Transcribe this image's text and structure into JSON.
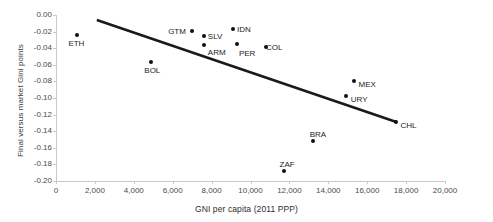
{
  "chart_data": {
    "type": "scatter",
    "title": "",
    "xlabel": "GNI per capita (2011 PPP)",
    "ylabel": "Final versus market Gini points",
    "xlim": [
      0,
      20000
    ],
    "ylim": [
      -0.2,
      0.0
    ],
    "grid": false,
    "legend": "none",
    "xticks": [
      "0",
      "2,000",
      "4,000",
      "6,000",
      "8,000",
      "10,000",
      "12,000",
      "14,000",
      "16,000",
      "18,000",
      "20,000"
    ],
    "xtick_values": [
      0,
      2000,
      4000,
      6000,
      8000,
      10000,
      12000,
      14000,
      16000,
      18000,
      20000
    ],
    "yticks": [
      "0.00",
      "-0.02",
      "-0.04",
      "-0.06",
      "-0.08",
      "-0.10",
      "-0.12",
      "-0.14",
      "-0.16",
      "-0.18",
      "-0.20"
    ],
    "ytick_values": [
      0.0,
      -0.02,
      -0.04,
      -0.06,
      -0.08,
      -0.1,
      -0.12,
      -0.14,
      -0.16,
      -0.18,
      -0.2
    ],
    "points": [
      {
        "label": "ETH",
        "x": 1100,
        "y": -0.024,
        "label_dx": -9,
        "label_dy": 4
      },
      {
        "label": "BOL",
        "x": 4900,
        "y": -0.057,
        "label_dx": -7,
        "label_dy": 4
      },
      {
        "label": "GTM",
        "x": 7000,
        "y": -0.019,
        "label_dx": -24,
        "label_dy": -4
      },
      {
        "label": "SLV",
        "x": 7600,
        "y": -0.025,
        "label_dx": 4,
        "label_dy": -4
      },
      {
        "label": "ARM",
        "x": 7600,
        "y": -0.036,
        "label_dx": 4,
        "label_dy": 3
      },
      {
        "label": "IDN",
        "x": 9100,
        "y": -0.017,
        "label_dx": 4,
        "label_dy": -4
      },
      {
        "label": "PER",
        "x": 9300,
        "y": -0.035,
        "label_dx": 2,
        "label_dy": 5
      },
      {
        "label": "COL",
        "x": 10800,
        "y": -0.038,
        "label_dx": 0,
        "label_dy": -4
      },
      {
        "label": "MEX",
        "x": 15300,
        "y": -0.08,
        "label_dx": 5,
        "label_dy": -1
      },
      {
        "label": "URY",
        "x": 14900,
        "y": -0.098,
        "label_dx": 5,
        "label_dy": -1
      },
      {
        "label": "BRA",
        "x": 13200,
        "y": -0.152,
        "label_dx": -3,
        "label_dy": -11
      },
      {
        "label": "ZAF",
        "x": 11700,
        "y": -0.188,
        "label_dx": -4,
        "label_dy": -11
      },
      {
        "label": "CHL",
        "x": 17500,
        "y": -0.129,
        "label_dx": 4,
        "label_dy": -1
      }
    ],
    "trendline": {
      "x1": 2100,
      "y1": -0.006,
      "x2": 17500,
      "y2": -0.129
    }
  }
}
